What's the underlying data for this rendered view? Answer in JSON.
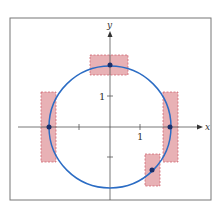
{
  "figure": {
    "x_axis_label": "x",
    "y_axis_label": "y",
    "x_tick_label": "1",
    "y_tick_label": "1",
    "colors": {
      "circle": "#2b6cc4",
      "point": "#1a2f6b",
      "box_fill": "#e4a3a8",
      "box_stroke": "#cc5a66",
      "axis": "#555555",
      "frame": "#777777"
    },
    "circle": {
      "center": [
        0,
        0
      ],
      "radius": 2
    },
    "points": [
      {
        "name": "top",
        "x": 0,
        "y": 2
      },
      {
        "name": "left",
        "x": -2,
        "y": 0
      },
      {
        "name": "right",
        "x": 2,
        "y": 0
      },
      {
        "name": "lower-right",
        "x": 1.4,
        "y": -1.4
      }
    ],
    "boxes": [
      {
        "name": "top-box"
      },
      {
        "name": "left-box"
      },
      {
        "name": "right-box"
      },
      {
        "name": "lower-right-box"
      }
    ]
  }
}
